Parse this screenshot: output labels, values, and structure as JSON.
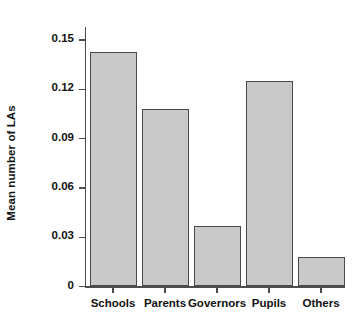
{
  "chart_data": {
    "type": "bar",
    "title": "",
    "subtitle": "",
    "xlabel": "",
    "ylabel": "Mean number of LAs",
    "categories": [
      "Schools",
      "Parents",
      "Governors",
      "Pupils",
      "Others"
    ],
    "values": [
      0.143,
      0.108,
      0.037,
      0.125,
      0.018
    ],
    "series": [
      {
        "name": "Mean number of LAs",
        "values": [
          0.143,
          0.108,
          0.037,
          0.125,
          0.018
        ]
      }
    ],
    "ylim": [
      0,
      0.158
    ],
    "ytick_values": [
      0,
      0.03,
      0.06,
      0.09,
      0.12,
      0.15
    ],
    "ytick_labels": [
      "0",
      "0.03",
      "0.06",
      "0.09",
      "0.12",
      "0.15"
    ],
    "grid": false,
    "legend": null,
    "legend_position": "none",
    "bar_fill_color": "#c9c9c9",
    "bar_edge_color": "#4a4a4a",
    "axis_color": "#4d4d4d",
    "background_color": "#ffffff",
    "annotations": []
  }
}
